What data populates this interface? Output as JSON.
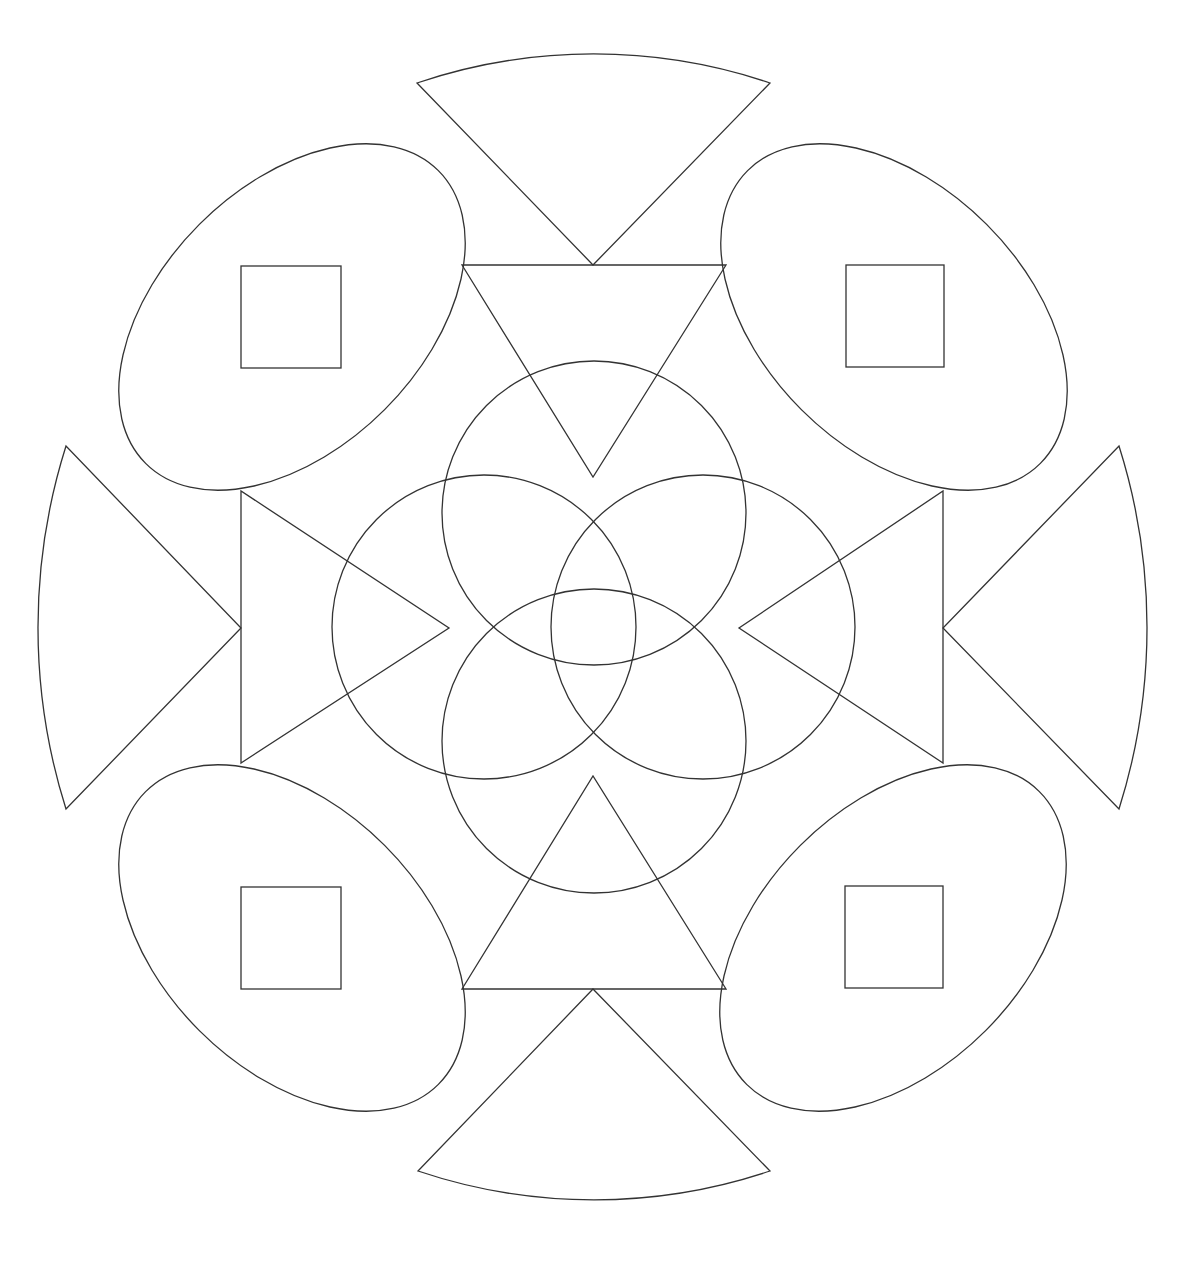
{
  "colors": {
    "background": "#ffffff",
    "stroke": "#333333"
  },
  "stroke_width": 1.3,
  "center": [
    593,
    628
  ],
  "wedges": [
    {
      "name": "top",
      "p1": [
        417,
        83
      ],
      "p2": [
        770,
        83
      ],
      "apex": [
        593,
        265
      ],
      "arc_radius": 551
    },
    {
      "name": "bottom",
      "p1": [
        418,
        1171
      ],
      "p2": [
        770,
        1171
      ],
      "apex": [
        593,
        989
      ],
      "arc_radius": 551
    },
    {
      "name": "left",
      "p1": [
        66,
        446
      ],
      "p2": [
        66,
        809
      ],
      "apex": [
        241,
        628
      ],
      "arc_radius": 602
    },
    {
      "name": "right",
      "p1": [
        1119,
        446
      ],
      "p2": [
        1119,
        809
      ],
      "apex": [
        943,
        628
      ],
      "arc_radius": 602
    }
  ],
  "ovals": [
    {
      "name": "top-left",
      "cx": 292,
      "cy": 317,
      "rx": 207,
      "ry": 131,
      "rotate": -45,
      "square": [
        241,
        266,
        100,
        102
      ]
    },
    {
      "name": "top-right",
      "cx": 894,
      "cy": 317,
      "rx": 207,
      "ry": 131,
      "rotate": 45,
      "square": [
        846,
        265,
        98,
        102
      ]
    },
    {
      "name": "bottom-left",
      "cx": 292,
      "cy": 938,
      "rx": 207,
      "ry": 131,
      "rotate": 45,
      "square": [
        241,
        887,
        100,
        102
      ]
    },
    {
      "name": "bottom-right",
      "cx": 893,
      "cy": 938,
      "rx": 207,
      "ry": 131,
      "rotate": -45,
      "square": [
        845,
        886,
        98,
        102
      ]
    }
  ],
  "inner_triangles": [
    {
      "name": "top",
      "points": [
        [
          462,
          265
        ],
        [
          726,
          265
        ],
        [
          593,
          477
        ]
      ]
    },
    {
      "name": "bottom",
      "points": [
        [
          462,
          989
        ],
        [
          726,
          989
        ],
        [
          593,
          776
        ]
      ]
    },
    {
      "name": "left",
      "points": [
        [
          241,
          491
        ],
        [
          241,
          763
        ],
        [
          449,
          628
        ]
      ]
    },
    {
      "name": "right",
      "points": [
        [
          943,
          491
        ],
        [
          943,
          763
        ],
        [
          739,
          628
        ]
      ]
    }
  ],
  "circles": [
    {
      "name": "top",
      "cx": 594,
      "cy": 513,
      "r": 152
    },
    {
      "name": "bottom",
      "cx": 594,
      "cy": 741,
      "r": 152
    },
    {
      "name": "left",
      "cx": 484,
      "cy": 627,
      "r": 152
    },
    {
      "name": "right",
      "cx": 703,
      "cy": 627,
      "r": 152
    }
  ]
}
